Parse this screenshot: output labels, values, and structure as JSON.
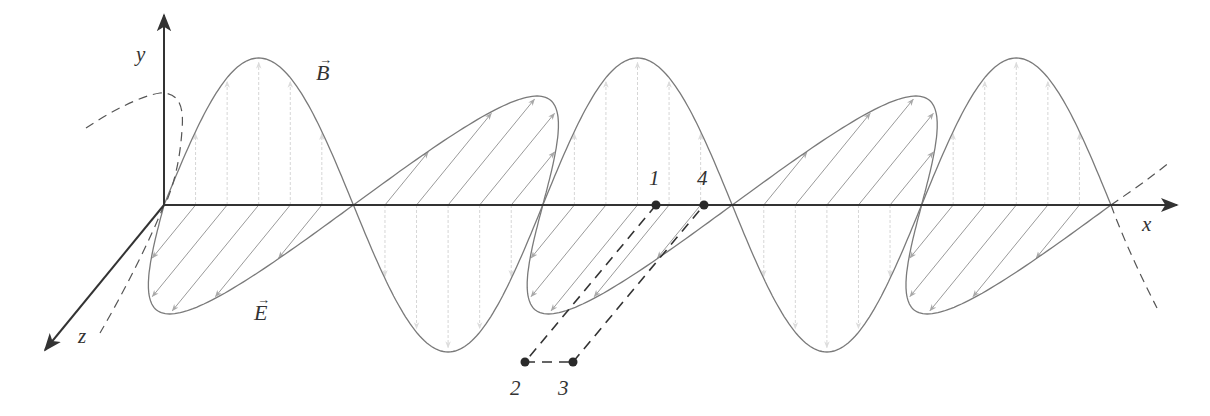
{
  "labels": {
    "y_axis": "y",
    "x_axis": "x",
    "z_axis": "z",
    "b_field": "B",
    "e_field": "E",
    "vector_arrow": "→",
    "points": [
      "1",
      "2",
      "3",
      "4"
    ]
  },
  "geometry": {
    "origin": [
      164,
      205
    ],
    "x_axis_end": 1177,
    "y_axis_top": 15,
    "z_axis_end": [
      45,
      350
    ],
    "half_wavelength_px": 189.4,
    "num_half_periods": 5,
    "b_amplitude_px": 147,
    "e_direction_px": [
      -89,
      109
    ],
    "vectors_per_half_period": 5
  },
  "points": [
    {
      "label": "1",
      "x": 656,
      "y": 205
    },
    {
      "label": "2",
      "x": 525,
      "y": 362
    },
    {
      "label": "3",
      "x": 573,
      "y": 362
    },
    {
      "label": "4",
      "x": 704,
      "y": 205
    }
  ],
  "colors": {
    "axis": "#333333",
    "curve": "#7a7a7a",
    "e_vectors": "#9a9a9a",
    "b_vectors": "#d6d6d6",
    "dashed": "#555555",
    "points": "#2a2a2a"
  }
}
